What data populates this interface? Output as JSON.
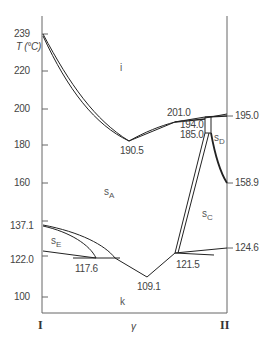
{
  "diagram": {
    "type": "binary-phase-diagram",
    "y_axis": {
      "label": "T (°C)",
      "ticks": [
        "239",
        "220",
        "200",
        "180",
        "160",
        "137.1",
        "122.0",
        "100"
      ]
    },
    "x_axis": {
      "label": "γ",
      "left_end": "I",
      "right_end": "II"
    },
    "right_axis_values": [
      "195.0",
      "158.9",
      "124.6"
    ],
    "point_labels": {
      "p190_5": "190.5",
      "p201_0": "201.0",
      "p194_0": "194.0",
      "p185_0": "185.0",
      "p117_6": "117.6",
      "p109_1": "109.1",
      "p121_5": "121.5"
    },
    "phases": {
      "i": "i",
      "sA": {
        "base": "s",
        "sub": "A"
      },
      "sC": {
        "base": "s",
        "sub": "C"
      },
      "sD": {
        "base": "s",
        "sub": "D"
      },
      "sE": {
        "base": "s",
        "sub": "E"
      },
      "k": "k"
    }
  }
}
